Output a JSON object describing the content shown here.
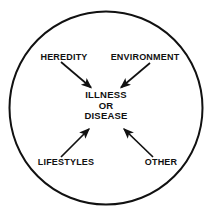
{
  "diagram": {
    "type": "influence-diagram",
    "shape": "circle",
    "background_color": "#ffffff",
    "stroke_color": "#111111",
    "boundary": {
      "name": "circle-boundary",
      "cx": 106,
      "cy": 108,
      "r": 97,
      "stroke_width": 2
    },
    "center_node": {
      "name": "illness-or-disease",
      "lines": [
        "ILLNESS",
        "OR",
        "DISEASE"
      ],
      "x": 106,
      "y": 106
    },
    "factors": [
      {
        "name": "heredity",
        "label": "HEREDITY",
        "label_x": 64,
        "label_y": 57,
        "arrow": {
          "x1": 61,
          "y1": 62,
          "x2": 93,
          "y2": 89
        }
      },
      {
        "name": "environment",
        "label": "ENVIRONMENT",
        "label_x": 145,
        "label_y": 57,
        "arrow": {
          "x1": 150,
          "y1": 63,
          "x2": 119,
          "y2": 89
        }
      },
      {
        "name": "lifestyles",
        "label": "LIFESTYLES",
        "label_x": 66,
        "label_y": 162,
        "arrow": {
          "x1": 61,
          "y1": 157,
          "x2": 91,
          "y2": 127
        }
      },
      {
        "name": "other",
        "label": "OTHER",
        "label_x": 161,
        "label_y": 162,
        "arrow": {
          "x1": 153,
          "y1": 157,
          "x2": 122,
          "y2": 127
        }
      }
    ]
  }
}
